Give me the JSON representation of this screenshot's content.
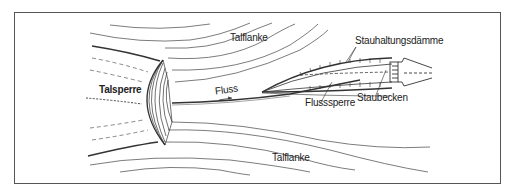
{
  "diagram": {
    "type": "schematic plan view of a dam and river reservoir",
    "labels": {
      "valley_flank_top": "Talflanke",
      "valley_flank_bottom": "Talflanke",
      "dam": "Talsperre",
      "river": "Fluss",
      "reservoir_dikes": "Stauhaltungsdämme",
      "river_barrage": "Flusssperre",
      "reservoir": "Staubecken"
    },
    "flow_direction": "left-to-right arrow under Fluss",
    "colors": {
      "line": "#333333",
      "frame": "#555555",
      "background": "#ffffff"
    }
  }
}
